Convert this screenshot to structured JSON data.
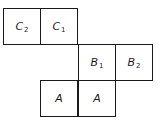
{
  "diagram": {
    "cells": [
      {
        "id": "c2",
        "label": "C",
        "sub": "2",
        "row": 0,
        "col": 0
      },
      {
        "id": "c1",
        "label": "C",
        "sub": "1",
        "row": 0,
        "col": 1
      },
      {
        "id": "b1",
        "label": "B",
        "sub": "1",
        "row": 1,
        "col": 2
      },
      {
        "id": "b2",
        "label": "B",
        "sub": "2",
        "row": 1,
        "col": 3
      },
      {
        "id": "a_left",
        "label": "A",
        "sub": "",
        "row": 2,
        "col": 1
      },
      {
        "id": "a_right",
        "label": "A",
        "sub": "",
        "row": 2,
        "col": 2
      }
    ]
  }
}
